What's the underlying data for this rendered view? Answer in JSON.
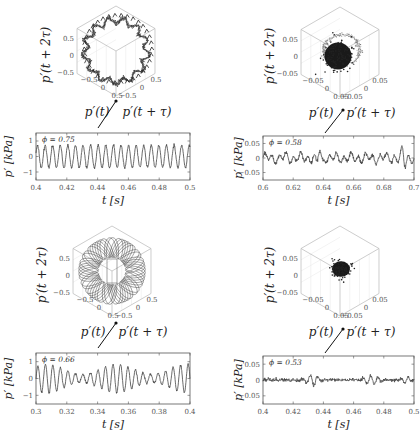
{
  "figure": {
    "panels": [
      {
        "id": "top-left",
        "phi_label": "ϕ = 0.75",
        "phase_space": {
          "zlabel": "p′(t + 2τ)",
          "xlabel": "p′(t)",
          "ylabel": "p′(t + τ)",
          "z_ticks": [
            "0.5",
            "0",
            "−0.5"
          ],
          "x_ticks": [
            "−0.5",
            "0",
            "0.5"
          ],
          "y_ticks": [
            "−0.5",
            "0",
            "0.5"
          ],
          "attractor": "limit-cycle-ring"
        },
        "time_series": {
          "ylabel": "p′ [kPa]",
          "xlabel": "t [s]",
          "y_ticks": [
            "1",
            "0",
            "−1"
          ],
          "x_ticks": [
            "0.4",
            "0.42",
            "0.44",
            "0.46",
            "0.48",
            "0.5"
          ]
        }
      },
      {
        "id": "top-right",
        "phi_label": "ϕ = 0.58",
        "phase_space": {
          "zlabel": "p′(t + 2τ)",
          "xlabel": "p′(t)",
          "ylabel": "p′(t + τ)",
          "z_ticks": [
            "0.05",
            "0",
            "−0.05"
          ],
          "x_ticks": [
            "−0.05",
            "0",
            "0.05"
          ],
          "y_ticks": [
            "−0.05",
            "0",
            "0.05"
          ],
          "attractor": "blob-with-loops"
        },
        "time_series": {
          "ylabel": "p′ [kPa]",
          "xlabel": "t [s]",
          "y_ticks": [
            "0.05",
            "0",
            "−0.05"
          ],
          "x_ticks": [
            "0.6",
            "0.62",
            "0.64",
            "0.66",
            "0.68",
            "0.7"
          ]
        }
      },
      {
        "id": "bottom-left",
        "phi_label": "ϕ = 0.66",
        "phase_space": {
          "zlabel": "p′(t + 2τ)",
          "xlabel": "p′(t)",
          "ylabel": "p′(t + τ)",
          "z_ticks": [
            "0.5",
            "0",
            "−0.5"
          ],
          "x_ticks": [
            "−0.5",
            "0",
            "0.5"
          ],
          "y_ticks": [
            "−0.5",
            "0",
            "0.5"
          ],
          "attractor": "torus"
        },
        "time_series": {
          "ylabel": "p′ [kPa]",
          "xlabel": "t [s]",
          "y_ticks": [
            "1",
            "0",
            "−1"
          ],
          "x_ticks": [
            "0.3",
            "0.32",
            "0.34",
            "0.36",
            "0.38",
            "0.4"
          ]
        }
      },
      {
        "id": "bottom-right",
        "phi_label": "ϕ = 0.53",
        "phase_space": {
          "zlabel": "p′(t + 2τ)",
          "xlabel": "p′(t)",
          "ylabel": "p′(t + τ)",
          "z_ticks": [
            "0.05",
            "0",
            "−0.05"
          ],
          "x_ticks": [
            "−0.05",
            "0",
            "0.05"
          ],
          "y_ticks": [
            "−0.05",
            "0",
            "0.05"
          ],
          "attractor": "noise-blob"
        },
        "time_series": {
          "ylabel": "p′ [kPa]",
          "xlabel": "t [s]",
          "y_ticks": [
            "0.05",
            "0",
            "−0.05"
          ],
          "x_ticks": [
            "0.4",
            "0.42",
            "0.44",
            "0.46",
            "0.48",
            "0.5"
          ]
        }
      }
    ]
  },
  "chart_data": [
    {
      "type": "line",
      "title": "ϕ = 0.75 pressure time series",
      "xlabel": "t [s]",
      "ylabel": "p′ [kPa]",
      "xlim": [
        0.4,
        0.5
      ],
      "ylim": [
        -1.4,
        1.4
      ],
      "x_ticks": [
        0.4,
        0.42,
        0.44,
        0.46,
        0.48,
        0.5
      ],
      "y_ticks": [
        -1,
        0,
        1
      ],
      "series": [
        {
          "name": "p′",
          "description": "periodic limit cycle, ~20 cycles in 0.1 s (~200 Hz), amplitude ~0.7 kPa"
        }
      ],
      "frequency_hz": 200,
      "amplitude": 0.7
    },
    {
      "type": "scatter",
      "title": "ϕ = 0.75 phase space",
      "xlabel": "p′(t)",
      "ylabel": "p′(t + τ)",
      "zlabel": "p′(t + 2τ)",
      "xlim": [
        -0.7,
        0.7
      ],
      "ylim": [
        -0.7,
        0.7
      ],
      "zlim": [
        -0.7,
        0.7
      ],
      "description": "ring-shaped limit cycle attractor, radius ~0.6"
    },
    {
      "type": "line",
      "title": "ϕ = 0.58 pressure time series",
      "xlabel": "t [s]",
      "ylabel": "p′ [kPa]",
      "xlim": [
        0.6,
        0.7
      ],
      "ylim": [
        -0.06,
        0.06
      ],
      "x_ticks": [
        0.6,
        0.62,
        0.64,
        0.66,
        0.68,
        0.7
      ],
      "y_ticks": [
        -0.05,
        0,
        0.05
      ],
      "series": [
        {
          "name": "p′",
          "description": "intermittent low-amplitude fluctuations, peaks ~0.04 near t=0.637 and t=0.694"
        }
      ],
      "amplitude": 0.03
    },
    {
      "type": "scatter",
      "title": "ϕ = 0.58 phase space",
      "xlabel": "p′(t)",
      "ylabel": "p′(t + τ)",
      "zlabel": "p′(t + 2τ)",
      "xlim": [
        -0.07,
        0.07
      ],
      "ylim": [
        -0.07,
        0.07
      ],
      "zlim": [
        -0.07,
        0.07
      ],
      "description": "dense central blob with outer loop excursions"
    },
    {
      "type": "line",
      "title": "ϕ = 0.66 pressure time series",
      "xlabel": "t [s]",
      "ylabel": "p′ [kPa]",
      "xlim": [
        0.3,
        0.4
      ],
      "ylim": [
        -1.4,
        1.4
      ],
      "x_ticks": [
        0.3,
        0.32,
        0.34,
        0.36,
        0.38,
        0.4
      ],
      "y_ticks": [
        -1,
        0,
        1
      ],
      "series": [
        {
          "name": "p′",
          "description": "quasi-periodic oscillation with amplitude modulation, ~200 Hz carrier, amplitude 0.3–0.8"
        }
      ],
      "frequency_hz": 200,
      "amplitude": 0.8
    },
    {
      "type": "scatter",
      "title": "ϕ = 0.66 phase space",
      "xlabel": "p′(t)",
      "ylabel": "p′(t + τ)",
      "zlabel": "p′(t + 2τ)",
      "xlim": [
        -0.7,
        0.7
      ],
      "ylim": [
        -0.7,
        0.7
      ],
      "zlim": [
        -0.7,
        0.7
      ],
      "description": "torus-shaped quasi-periodic attractor"
    },
    {
      "type": "line",
      "title": "ϕ = 0.53 pressure time series",
      "xlabel": "t [s]",
      "ylabel": "p′ [kPa]",
      "xlim": [
        0.4,
        0.5
      ],
      "ylim": [
        -0.06,
        0.06
      ],
      "x_ticks": [
        0.4,
        0.42,
        0.44,
        0.46,
        0.48,
        0.5
      ],
      "y_ticks": [
        -0.05,
        0,
        0.05
      ],
      "series": [
        {
          "name": "p′",
          "description": "near-zero noisy signal with small bursts (~0.02) around t=0.43, 0.47, 0.49"
        }
      ],
      "amplitude": 0.015
    },
    {
      "type": "scatter",
      "title": "ϕ = 0.53 phase space",
      "xlabel": "p′(t)",
      "ylabel": "p′(t + τ)",
      "zlabel": "p′(t + 2τ)",
      "xlim": [
        -0.07,
        0.07
      ],
      "ylim": [
        -0.07,
        0.07
      ],
      "zlim": [
        -0.07,
        0.07
      ],
      "description": "small compact noise blob at origin"
    }
  ]
}
